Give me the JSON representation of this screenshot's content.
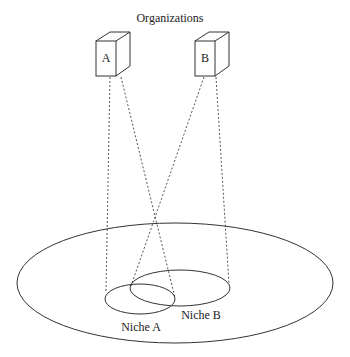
{
  "title": "Organizations",
  "organizations": [
    {
      "label": "A"
    },
    {
      "label": "B"
    }
  ],
  "niches": [
    {
      "label": "Niche A"
    },
    {
      "label": "Niche B"
    }
  ]
}
